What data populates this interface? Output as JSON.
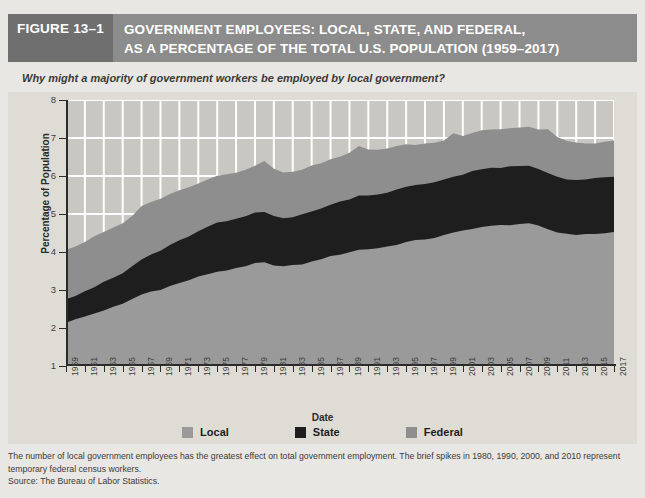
{
  "header": {
    "figure_number": "FIGURE 13–1",
    "title_line1": "GOVERNMENT EMPLOYEES: LOCAL, STATE, AND FEDERAL,",
    "title_line2": "AS A PERCENTAGE OF THE TOTAL U.S. POPULATION (1959–2017)",
    "bar_color": "#8c8c8c",
    "number_block_color": "#6f6f6f"
  },
  "question": "Why might a majority of government workers be employed by local government?",
  "legend": [
    {
      "label": "Local",
      "color": "#9a9a9a"
    },
    {
      "label": "State",
      "color": "#1e1e1e"
    },
    {
      "label": "Federal",
      "color": "#8e8e8e"
    }
  ],
  "footnote": {
    "body": "The number of local government employees has the greatest effect on total government employment. The brief spikes in 1980, 1990, 2000, and 2010 represent temporary federal census workers.",
    "source": "Source: The Bureau of Labor Statistics."
  },
  "chart_data": {
    "type": "area",
    "stacked": true,
    "title": "GOVERNMENT EMPLOYEES: LOCAL, STATE, AND FEDERAL, AS A PERCENTAGE OF THE TOTAL U.S. POPULATION (1959–2017)",
    "xlabel": "Date",
    "ylabel": "Percentage of Population",
    "ylim": [
      1,
      8
    ],
    "yticks": [
      1,
      2,
      3,
      4,
      5,
      6,
      7,
      8
    ],
    "xlim": [
      1959,
      2017
    ],
    "xticks": [
      1959,
      1961,
      1963,
      1965,
      1967,
      1969,
      1971,
      1973,
      1975,
      1977,
      1979,
      1981,
      1983,
      1985,
      1987,
      1989,
      1991,
      1993,
      1995,
      1997,
      1999,
      2001,
      2003,
      2005,
      2007,
      2009,
      2011,
      2013,
      2015,
      2017
    ],
    "grid": "horizontal-and-vertical white gridlines, visible only above the stacked areas",
    "legend_position": "bottom-center",
    "baseline": 1,
    "x": [
      1959,
      1960,
      1961,
      1962,
      1963,
      1964,
      1965,
      1966,
      1967,
      1968,
      1969,
      1970,
      1971,
      1972,
      1973,
      1974,
      1975,
      1976,
      1977,
      1978,
      1979,
      1980,
      1981,
      1982,
      1983,
      1984,
      1985,
      1986,
      1987,
      1988,
      1989,
      1990,
      1991,
      1992,
      1993,
      1994,
      1995,
      1996,
      1997,
      1998,
      1999,
      2000,
      2001,
      2002,
      2003,
      2004,
      2005,
      2006,
      2007,
      2008,
      2009,
      2010,
      2011,
      2012,
      2013,
      2014,
      2015,
      2016,
      2017
    ],
    "series": [
      {
        "name": "Local",
        "color": "#9a9a9a",
        "note": "bottom band, plotted from baseline 1 up to the cumulative Local value",
        "values": [
          2.15,
          2.22,
          2.3,
          2.38,
          2.47,
          2.55,
          2.63,
          2.76,
          2.88,
          2.96,
          3.02,
          3.1,
          3.18,
          3.26,
          3.34,
          3.42,
          3.48,
          3.52,
          3.56,
          3.62,
          3.7,
          3.72,
          3.66,
          3.62,
          3.64,
          3.68,
          3.74,
          3.82,
          3.88,
          3.94,
          4.0,
          4.06,
          4.08,
          4.1,
          4.14,
          4.2,
          4.26,
          4.3,
          4.34,
          4.38,
          4.44,
          4.5,
          4.56,
          4.62,
          4.66,
          4.68,
          4.7,
          4.72,
          4.74,
          4.74,
          4.68,
          4.6,
          4.52,
          4.48,
          4.46,
          4.46,
          4.48,
          4.5,
          4.52
        ]
      },
      {
        "name": "State",
        "color": "#1e1e1e",
        "note": "middle dark band; values are the band thickness in percentage points",
        "values": [
          0.62,
          0.64,
          0.67,
          0.7,
          0.73,
          0.77,
          0.81,
          0.86,
          0.92,
          0.97,
          1.02,
          1.07,
          1.12,
          1.16,
          1.2,
          1.24,
          1.28,
          1.29,
          1.3,
          1.32,
          1.34,
          1.33,
          1.3,
          1.28,
          1.28,
          1.3,
          1.32,
          1.34,
          1.36,
          1.38,
          1.4,
          1.42,
          1.42,
          1.42,
          1.43,
          1.44,
          1.45,
          1.45,
          1.45,
          1.46,
          1.47,
          1.48,
          1.49,
          1.51,
          1.52,
          1.52,
          1.52,
          1.52,
          1.52,
          1.52,
          1.5,
          1.48,
          1.46,
          1.44,
          1.44,
          1.44,
          1.45,
          1.46,
          1.47
        ]
      },
      {
        "name": "Federal",
        "color": "#8e8e8e",
        "note": "top band; values are band thickness, spikes in 1980, 1990, 2000, 2010 are temporary census workers",
        "values": [
          1.3,
          1.29,
          1.3,
          1.32,
          1.32,
          1.31,
          1.31,
          1.34,
          1.4,
          1.4,
          1.37,
          1.35,
          1.32,
          1.3,
          1.28,
          1.26,
          1.25,
          1.24,
          1.24,
          1.24,
          1.24,
          1.34,
          1.22,
          1.2,
          1.2,
          1.2,
          1.2,
          1.19,
          1.19,
          1.19,
          1.2,
          1.3,
          1.2,
          1.18,
          1.16,
          1.14,
          1.11,
          1.08,
          1.06,
          1.04,
          1.03,
          1.14,
          1.02,
          1.02,
          1.03,
          1.03,
          1.02,
          1.02,
          1.02,
          1.03,
          1.05,
          1.15,
          1.04,
          1.0,
          0.97,
          0.95,
          0.94,
          0.94,
          0.94
        ]
      }
    ],
    "annotations": [
      "Brief federal spikes in 1980, 1990, 2000, and 2010 represent temporary census workers."
    ]
  }
}
